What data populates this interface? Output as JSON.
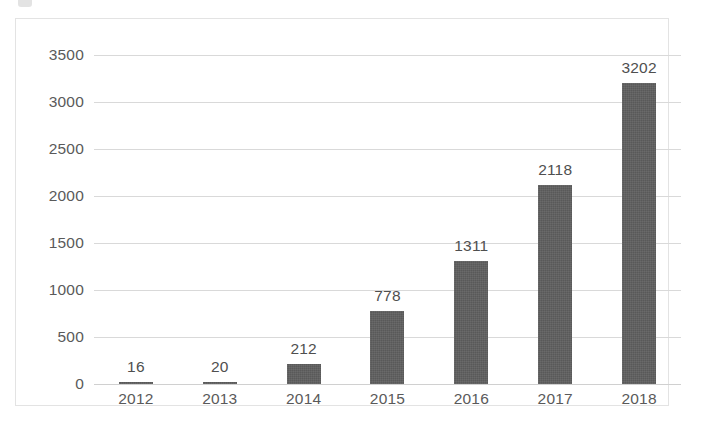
{
  "chart_data": {
    "type": "bar",
    "title": "",
    "subtitle": "",
    "xlabel": "",
    "ylabel": "",
    "categories": [
      "2012",
      "2013",
      "2014",
      "2015",
      "2016",
      "2017",
      "2018"
    ],
    "values": [
      16,
      20,
      212,
      778,
      1311,
      2118,
      3202
    ],
    "data_labels": [
      "16",
      "20",
      "212",
      "778",
      "1311",
      "2118",
      "3202"
    ],
    "ylim": [
      0,
      3500
    ],
    "ytick_values": [
      0,
      500,
      1000,
      1500,
      2000,
      2500,
      3000,
      3500
    ],
    "ytick_labels": [
      "0",
      "500",
      "1000",
      "1500",
      "2000",
      "2500",
      "3000",
      "3500"
    ],
    "grid": true,
    "grid_axis": "y",
    "legend": false,
    "legend_position": "none",
    "series": [
      {
        "name": "",
        "values": [
          16,
          20,
          212,
          778,
          1311,
          2118,
          3202
        ]
      }
    ],
    "colors": {
      "bar": "#595959",
      "gridline": "#d9d9d9",
      "axis_text": "#5a5a5a",
      "label_text": "#4f4f4f",
      "frame": "#e3e3e3",
      "background": "#ffffff"
    }
  }
}
